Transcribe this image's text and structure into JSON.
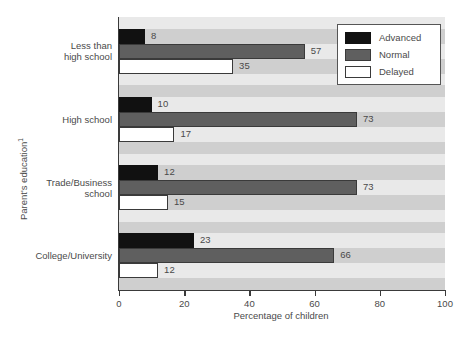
{
  "chart_data": {
    "type": "bar",
    "orientation": "horizontal",
    "title": "",
    "xlabel": "Percentage of children",
    "ylabel": "Parent's education",
    "ylabel_superscript": "1",
    "xlim": [
      0,
      100
    ],
    "xticks": [
      0,
      20,
      40,
      60,
      80,
      100
    ],
    "grid": false,
    "legend_position": "top-right",
    "categories": [
      "Less than high school",
      "High school",
      "Trade/Business school",
      "College/University"
    ],
    "category_lines": [
      [
        "Less than",
        "high school"
      ],
      [
        "High school"
      ],
      [
        "Trade/Business",
        "school"
      ],
      [
        "College/University"
      ]
    ],
    "series": [
      {
        "name": "Advanced",
        "color": "#111111",
        "values": [
          8,
          10,
          12,
          23
        ]
      },
      {
        "name": "Normal",
        "color": "#5f5f5f",
        "values": [
          57,
          73,
          73,
          66
        ]
      },
      {
        "name": "Delayed",
        "color": "#ffffff",
        "values": [
          35,
          17,
          15,
          12
        ]
      }
    ]
  },
  "legend": {
    "items": [
      {
        "label": "Advanced",
        "swatch": "advanced"
      },
      {
        "label": "Normal",
        "swatch": "normal"
      },
      {
        "label": "Delayed",
        "swatch": "delayed"
      }
    ]
  },
  "axes": {
    "x_title": "Percentage of children",
    "y_title": "Parent's education",
    "y_title_superscript": "1",
    "x_tick_labels": [
      "0",
      "20",
      "40",
      "60",
      "80",
      "100"
    ]
  }
}
